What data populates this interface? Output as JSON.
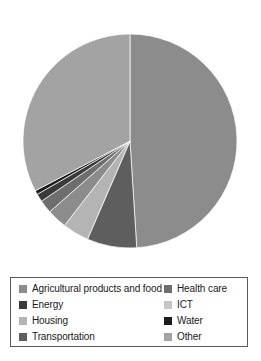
{
  "chart_data": {
    "type": "pie",
    "title": "",
    "subtitle": "",
    "xlabel": "",
    "ylabel": "",
    "grid": false,
    "legend_position": "bottom",
    "start_angle_deg": 0,
    "direction": "clockwise",
    "categories": [
      "Agricultural products and food",
      "Health care",
      "Energy",
      "ICT",
      "Housing",
      "Water",
      "Transportation",
      "Other"
    ],
    "slices": [
      {
        "label": "Other",
        "value": 49.0,
        "color": "#8c8c8c"
      },
      {
        "label": "Transportation",
        "value": 7.5,
        "color": "#5e5e5e"
      },
      {
        "label": "Housing",
        "value": 4.0,
        "color": "#b4b4b4"
      },
      {
        "label": "Agricultural products and food",
        "value": 3.0,
        "color": "#8c8c8c"
      },
      {
        "label": "Health care",
        "value": 2.0,
        "color": "#6e6e6e"
      },
      {
        "label": "Energy",
        "value": 1.2,
        "color": "#3a3a3a"
      },
      {
        "label": "Water",
        "value": 0.6,
        "color": "#1c1c1c"
      },
      {
        "label": "ICT",
        "value": 32.7,
        "color": "#a3a3a3"
      }
    ],
    "values": [
      3.0,
      2.0,
      1.2,
      32.7,
      4.0,
      0.6,
      7.5,
      49.0
    ]
  },
  "legend": {
    "items": [
      {
        "label": "Agricultural products and food",
        "color": "#8c8c8c",
        "swatch_name": "legend-swatch-agricultural-products-and-food"
      },
      {
        "label": "Health care",
        "color": "#6e6e6e",
        "swatch_name": "legend-swatch-health-care"
      },
      {
        "label": "Energy",
        "color": "#3a3a3a",
        "swatch_name": "legend-swatch-energy"
      },
      {
        "label": "ICT",
        "color": "#c6c6c6",
        "swatch_name": "legend-swatch-ict"
      },
      {
        "label": "Housing",
        "color": "#b4b4b4",
        "swatch_name": "legend-swatch-housing"
      },
      {
        "label": "Water",
        "color": "#1c1c1c",
        "swatch_name": "legend-swatch-water"
      },
      {
        "label": "Transportation",
        "color": "#5e5e5e",
        "swatch_name": "legend-swatch-transportation"
      },
      {
        "label": "Other",
        "color": "#a3a3a3",
        "swatch_name": "legend-swatch-other"
      }
    ]
  },
  "style": {
    "background": "#ffffff",
    "legend_border": "#5a5a5a",
    "pie_outline": "#ffffff",
    "center_x": 130,
    "center_y": 141,
    "radius": 107
  }
}
